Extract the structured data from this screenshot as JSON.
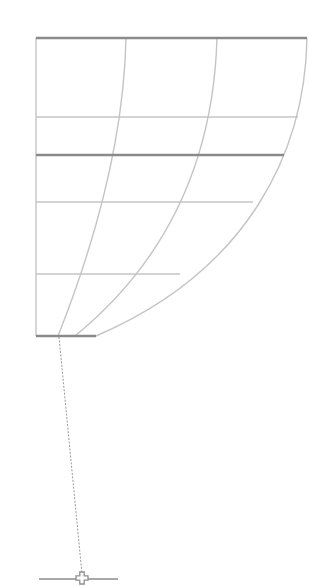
{
  "diagram": {
    "type": "curved-grid-with-plumb-line",
    "width": 309,
    "height": 586,
    "colors": {
      "thin_line": "#c4c4c4",
      "thick_line": "#8a8a8a",
      "dashed_line": "#9a9a9a",
      "base_line": "#a8a8a8",
      "background": "#ffffff"
    },
    "frame": {
      "left_x": 36,
      "top_y": 38,
      "bottom_y": 336
    },
    "thick_horizontals": [
      {
        "name": "top-edge",
        "y": 38,
        "x1": 36,
        "x2": 307
      },
      {
        "name": "middle-edge",
        "y": 155,
        "x1": 36,
        "x2": 284
      },
      {
        "name": "bottom-edge",
        "y": 336,
        "x1": 36,
        "x2": 96
      }
    ],
    "thin_horizontals": [
      {
        "y": 117,
        "x1": 36,
        "x2": 298
      },
      {
        "y": 202,
        "x1": 36,
        "x2": 253
      },
      {
        "y": 274,
        "x1": 36,
        "x2": 180
      }
    ],
    "curves": [
      {
        "name": "inner-curve",
        "d": "M126 38 C 124 130, 100 230, 58 336"
      },
      {
        "name": "middle-curve",
        "d": "M217 38 C 214 140, 180 250, 75 336"
      },
      {
        "name": "outer-curve",
        "d": "M307 38 C 305 150, 250 270, 96 336"
      }
    ],
    "plumb_line": {
      "x1": 59,
      "y1": 337,
      "x2": 82,
      "y2": 574
    },
    "base_line": {
      "y": 579,
      "x1": 39,
      "x2": 118
    },
    "marker": {
      "cx": 82,
      "cy": 578,
      "glyph": "crosshair-plus"
    }
  }
}
